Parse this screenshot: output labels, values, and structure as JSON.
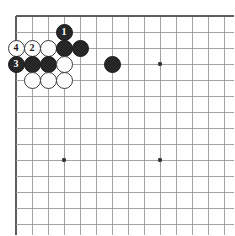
{
  "figure": {
    "kind": "go-board-diagram"
  },
  "board": {
    "origin_x": 16,
    "origin_y": 16,
    "spacing": 16,
    "cols": 14,
    "rows": 14,
    "line_color": "#9a9a9a",
    "edge_color": "#5d5d5d",
    "background_color": "#ffffff",
    "clip_width": 218,
    "clip_height": 219,
    "star_points": [
      {
        "col": 3,
        "row": 9
      },
      {
        "col": 9,
        "row": 3
      },
      {
        "col": 9,
        "row": 9
      }
    ],
    "star_color": "#3a3a3a",
    "star_radius": 2.2
  },
  "stone_style": {
    "diameter": 17,
    "black_color": "#272727",
    "white_color": "#fdfdfd",
    "white_border_color": "#3a3a3a",
    "black_border_color": "#1a1a1a"
  },
  "stones": [
    {
      "col": 3,
      "row": 1,
      "color": "black",
      "label": "1",
      "name": "stone-black-move-1"
    },
    {
      "col": 0,
      "row": 2,
      "color": "white",
      "label": "4",
      "name": "stone-white-move-4"
    },
    {
      "col": 1,
      "row": 2,
      "color": "white",
      "label": "2",
      "name": "stone-white-move-2"
    },
    {
      "col": 2,
      "row": 2,
      "color": "white",
      "label": "",
      "name": "stone-white"
    },
    {
      "col": 3,
      "row": 2,
      "color": "black",
      "label": "",
      "name": "stone-black"
    },
    {
      "col": 4,
      "row": 2,
      "color": "black",
      "label": "",
      "name": "stone-black"
    },
    {
      "col": 0,
      "row": 3,
      "color": "black",
      "label": "3",
      "name": "stone-black-move-3"
    },
    {
      "col": 1,
      "row": 3,
      "color": "black",
      "label": "",
      "name": "stone-black"
    },
    {
      "col": 2,
      "row": 3,
      "color": "black",
      "label": "",
      "name": "stone-black"
    },
    {
      "col": 3,
      "row": 3,
      "color": "white",
      "label": "",
      "name": "stone-white"
    },
    {
      "col": 6,
      "row": 3,
      "color": "black",
      "label": "",
      "name": "stone-black"
    },
    {
      "col": 1,
      "row": 4,
      "color": "white",
      "label": "",
      "name": "stone-white"
    },
    {
      "col": 2,
      "row": 4,
      "color": "white",
      "label": "",
      "name": "stone-white"
    },
    {
      "col": 3,
      "row": 4,
      "color": "white",
      "label": "",
      "name": "stone-white"
    }
  ]
}
